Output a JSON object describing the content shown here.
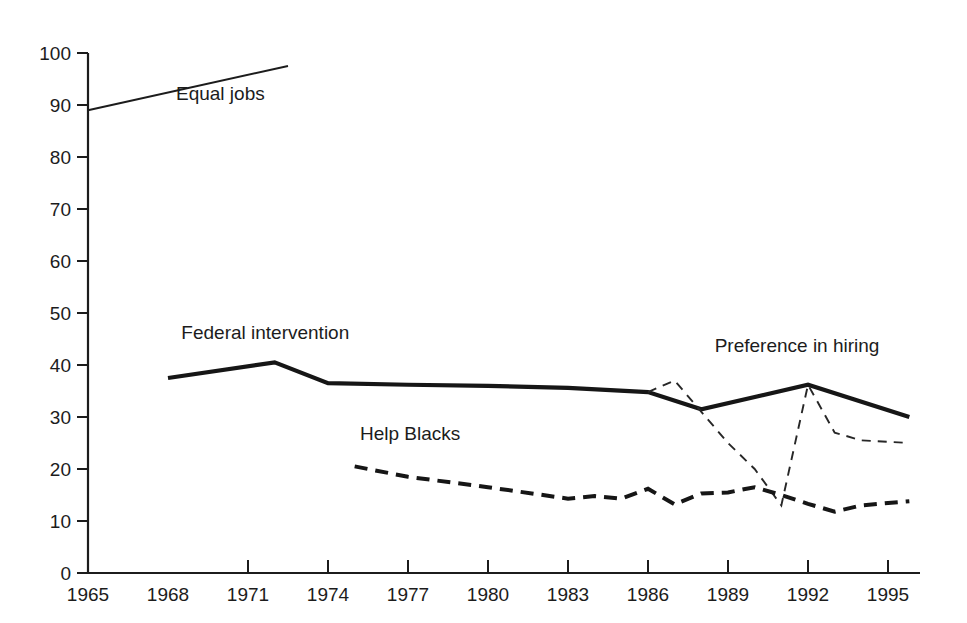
{
  "chart_data": {
    "type": "line",
    "title": "",
    "subtitle": "",
    "xlabel": "",
    "ylabel": "",
    "xlim": [
      1965,
      1996.2
    ],
    "ylim": [
      0,
      100
    ],
    "grid": false,
    "legend_position": "inline-labels",
    "x_ticks": [
      1965,
      1968,
      1971,
      1974,
      1977,
      1980,
      1983,
      1986,
      1989,
      1992,
      1995
    ],
    "x_tick_labels": [
      "1965",
      "1968",
      "1971",
      "1974",
      "1977",
      "1980",
      "1983",
      "1986",
      "1989",
      "1992",
      "1995"
    ],
    "y_ticks": [
      0,
      10,
      20,
      30,
      40,
      50,
      60,
      70,
      80,
      90,
      100
    ],
    "y_tick_labels": [
      "0",
      "10",
      "20",
      "30",
      "40",
      "50",
      "60",
      "70",
      "80",
      "90",
      "100"
    ],
    "series": [
      {
        "name": "Equal jobs",
        "label": "Equal jobs",
        "style": "solid-thin",
        "x": [
          1965,
          1972.5
        ],
        "values": [
          89,
          97.5
        ]
      },
      {
        "name": "Federal intervention",
        "label": "Federal intervention",
        "style": "solid-thick",
        "x": [
          1968,
          1972,
          1974,
          1977,
          1980,
          1983,
          1986,
          1988,
          1992,
          1995.8
        ],
        "values": [
          37.5,
          40.5,
          36.5,
          36.2,
          36.0,
          35.6,
          34.8,
          31.5,
          36.2,
          30.0
        ]
      },
      {
        "name": "Preference in hiring",
        "label": "Preference in hiring",
        "style": "dashed-thin",
        "x": [
          1986,
          1987,
          1988,
          1989,
          1990,
          1991,
          1992,
          1993,
          1994,
          1995.8
        ],
        "values": [
          34.8,
          37.0,
          31.0,
          25.0,
          20.0,
          13.0,
          36.2,
          27.0,
          25.5,
          25.0
        ]
      },
      {
        "name": "Help Blacks",
        "label": "Help Blacks",
        "style": "dashed-thick",
        "x": [
          1975,
          1977,
          1980,
          1983,
          1984,
          1985,
          1986,
          1987,
          1988,
          1989,
          1990,
          1991,
          1992,
          1993,
          1994,
          1995.8
        ],
        "values": [
          20.5,
          18.5,
          16.5,
          14.3,
          14.8,
          14.3,
          16.2,
          13.2,
          15.3,
          15.5,
          16.5,
          15.0,
          13.3,
          11.8,
          13.0,
          13.8
        ]
      }
    ],
    "annotations": [
      {
        "text": "Equal jobs",
        "x": 1968.3,
        "y": 91.0
      },
      {
        "text": "Federal intervention",
        "x": 1968.5,
        "y": 45.0
      },
      {
        "text": "Preference in hiring",
        "x": 1988.5,
        "y": 42.5
      },
      {
        "text": "Help Blacks",
        "x": 1975.2,
        "y": 25.5
      }
    ],
    "colors": {
      "ink": "#1c1c1c",
      "background": "#ffffff"
    }
  }
}
